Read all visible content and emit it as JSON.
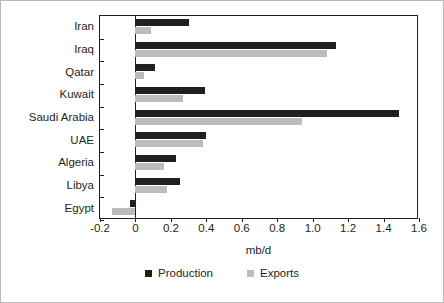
{
  "chart_data": {
    "type": "bar",
    "orientation": "horizontal",
    "title": "",
    "xlabel": "mb/d",
    "ylabel": "",
    "xlim": [
      -0.2,
      1.6
    ],
    "xticks": [
      "-0.2",
      "0",
      "0.2",
      "0.4",
      "0.6",
      "0.8",
      "1.0",
      "1.2",
      "1.4",
      "1.6"
    ],
    "xtick_values": [
      -0.2,
      0,
      0.2,
      0.4,
      0.6,
      0.8,
      1.0,
      1.2,
      1.4,
      1.6
    ],
    "grid": false,
    "legend_position": "bottom",
    "categories": [
      "Iran",
      "Iraq",
      "Qatar",
      "Kuwait",
      "Saudi Arabia",
      "UAE",
      "Algeria",
      "Libya",
      "Egypt"
    ],
    "series": [
      {
        "name": "Production",
        "color": "#231f20",
        "values": [
          0.3,
          1.13,
          0.11,
          0.39,
          1.49,
          0.4,
          0.23,
          0.25,
          -0.03
        ]
      },
      {
        "name": "Exports",
        "color": "#bcbcbc",
        "values": [
          0.09,
          1.08,
          0.05,
          0.27,
          0.94,
          0.38,
          0.16,
          0.18,
          -0.13
        ]
      }
    ]
  },
  "legend": {
    "items": [
      {
        "label": "Production",
        "swatch": "production"
      },
      {
        "label": "Exports",
        "swatch": "exports"
      }
    ]
  }
}
